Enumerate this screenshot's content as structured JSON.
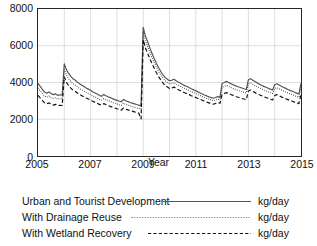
{
  "chart_data": {
    "type": "line",
    "title": "",
    "xlabel": "Year",
    "ylabel": "",
    "unit": "kg/day",
    "xlim": [
      2005,
      2015
    ],
    "ylim": [
      0,
      8000
    ],
    "yticks": [
      0,
      2000,
      4000,
      6000,
      8000
    ],
    "ytick_labels": [
      "0",
      "2000",
      "4000",
      "6000",
      "8000"
    ],
    "xticks": [
      2005,
      2007,
      2009,
      2011,
      2013,
      2015
    ],
    "xtick_labels": [
      "2005",
      "2007",
      "2009",
      "2011",
      "2013",
      "2015"
    ],
    "minor_xgrid_years": [
      2006,
      2008,
      2010,
      2012,
      2014
    ],
    "grid": true,
    "legend_position": "below-axes",
    "series": [
      {
        "name": "Urban and Tourist Development",
        "style": "solid",
        "color": "#555555",
        "unit": "kg/day",
        "x": [
          2005.0,
          2005.08,
          2005.17,
          2005.25,
          2005.33,
          2005.42,
          2005.5,
          2005.58,
          2005.67,
          2005.75,
          2005.83,
          2005.92,
          2006.0,
          2006.08,
          2006.17,
          2006.25,
          2006.33,
          2006.42,
          2006.5,
          2006.58,
          2006.67,
          2006.75,
          2006.83,
          2006.92,
          2007.0,
          2007.08,
          2007.17,
          2007.25,
          2007.33,
          2007.42,
          2007.5,
          2007.58,
          2007.67,
          2007.75,
          2007.83,
          2007.92,
          2008.0,
          2008.08,
          2008.17,
          2008.25,
          2008.33,
          2008.42,
          2008.5,
          2008.58,
          2008.67,
          2008.75,
          2008.83,
          2008.92,
          2009.0,
          2009.08,
          2009.17,
          2009.25,
          2009.33,
          2009.42,
          2009.5,
          2009.58,
          2009.67,
          2009.75,
          2009.83,
          2009.92,
          2010.0,
          2010.08,
          2010.17,
          2010.25,
          2010.33,
          2010.42,
          2010.5,
          2010.58,
          2010.67,
          2010.75,
          2010.83,
          2010.92,
          2011.0,
          2011.08,
          2011.17,
          2011.25,
          2011.33,
          2011.42,
          2011.5,
          2011.58,
          2011.67,
          2011.75,
          2011.83,
          2011.92,
          2012.0,
          2012.08,
          2012.17,
          2012.25,
          2012.33,
          2012.42,
          2012.5,
          2012.58,
          2012.67,
          2012.75,
          2012.83,
          2012.92,
          2013.0,
          2013.08,
          2013.17,
          2013.25,
          2013.33,
          2013.42,
          2013.5,
          2013.58,
          2013.67,
          2013.75,
          2013.83,
          2013.92,
          2014.0,
          2014.08,
          2014.17,
          2014.25,
          2014.33,
          2014.42,
          2014.5,
          2014.58,
          2014.67,
          2014.75,
          2014.83,
          2014.92,
          2015.0
        ],
        "y": [
          3950,
          3800,
          3620,
          3480,
          3420,
          3480,
          3400,
          3340,
          3380,
          3300,
          3330,
          3320,
          5020,
          4700,
          4480,
          4330,
          4200,
          4120,
          4020,
          3930,
          3850,
          3780,
          3700,
          3640,
          3580,
          3500,
          3430,
          3370,
          3300,
          3250,
          3350,
          3280,
          3220,
          3180,
          3120,
          3070,
          3030,
          2990,
          2950,
          3080,
          3010,
          2960,
          2910,
          2880,
          2840,
          2800,
          2770,
          2740,
          7000,
          6550,
          6200,
          5900,
          5600,
          5300,
          5050,
          4820,
          4600,
          4420,
          4280,
          4180,
          4100,
          4120,
          4180,
          4100,
          4030,
          3960,
          3890,
          3830,
          3780,
          3720,
          3660,
          3600,
          3550,
          3490,
          3430,
          3370,
          3320,
          3270,
          3220,
          3180,
          3140,
          3180,
          3230,
          3190,
          3950,
          4000,
          4060,
          4000,
          3940,
          3880,
          3830,
          3780,
          3740,
          3700,
          3660,
          3620,
          4150,
          4200,
          4120,
          4050,
          3980,
          3910,
          3850,
          3790,
          3740,
          3690,
          3640,
          3590,
          3880,
          3930,
          3860,
          3800,
          3740,
          3680,
          3620,
          3570,
          3520,
          3470,
          3420,
          3380,
          3950
        ]
      },
      {
        "name": "With Drainage Reuse",
        "style": "dotted",
        "color": "#3a3a3a",
        "unit": "kg/day",
        "x": [
          2005.0,
          2005.08,
          2005.17,
          2005.25,
          2005.33,
          2005.42,
          2005.5,
          2005.58,
          2005.67,
          2005.75,
          2005.83,
          2005.92,
          2006.0,
          2006.08,
          2006.17,
          2006.25,
          2006.33,
          2006.42,
          2006.5,
          2006.58,
          2006.67,
          2006.75,
          2006.83,
          2006.92,
          2007.0,
          2007.08,
          2007.17,
          2007.25,
          2007.33,
          2007.42,
          2007.5,
          2007.58,
          2007.67,
          2007.75,
          2007.83,
          2007.92,
          2008.0,
          2008.08,
          2008.17,
          2008.25,
          2008.33,
          2008.42,
          2008.5,
          2008.58,
          2008.67,
          2008.75,
          2008.83,
          2008.92,
          2009.0,
          2009.08,
          2009.17,
          2009.25,
          2009.33,
          2009.42,
          2009.5,
          2009.58,
          2009.67,
          2009.75,
          2009.83,
          2009.92,
          2010.0,
          2010.08,
          2010.17,
          2010.25,
          2010.33,
          2010.42,
          2010.5,
          2010.58,
          2010.67,
          2010.75,
          2010.83,
          2010.92,
          2011.0,
          2011.08,
          2011.17,
          2011.25,
          2011.33,
          2011.42,
          2011.5,
          2011.58,
          2011.67,
          2011.75,
          2011.83,
          2011.92,
          2012.0,
          2012.08,
          2012.17,
          2012.25,
          2012.33,
          2012.42,
          2012.5,
          2012.58,
          2012.67,
          2012.75,
          2012.83,
          2012.92,
          2013.0,
          2013.08,
          2013.17,
          2013.25,
          2013.33,
          2013.42,
          2013.5,
          2013.58,
          2013.67,
          2013.75,
          2013.83,
          2013.92,
          2014.0,
          2014.08,
          2014.17,
          2014.25,
          2014.33,
          2014.42,
          2014.5,
          2014.58,
          2014.67,
          2014.75,
          2014.83,
          2014.92,
          2015.0
        ],
        "y": [
          3700,
          3560,
          3390,
          3260,
          3200,
          3260,
          3180,
          3130,
          3170,
          3090,
          3120,
          3110,
          4700,
          4400,
          4190,
          4050,
          3930,
          3850,
          3760,
          3670,
          3600,
          3530,
          3460,
          3400,
          3350,
          3270,
          3200,
          3150,
          3080,
          3040,
          3130,
          3070,
          3010,
          2970,
          2920,
          2870,
          2830,
          2790,
          2760,
          2880,
          2810,
          2770,
          2720,
          2690,
          2650,
          2620,
          2590,
          2560,
          6730,
          6290,
          5950,
          5660,
          5370,
          5080,
          4840,
          4620,
          4410,
          4240,
          4100,
          4000,
          3920,
          3940,
          4000,
          3920,
          3850,
          3790,
          3720,
          3670,
          3620,
          3560,
          3500,
          3450,
          3400,
          3340,
          3290,
          3230,
          3180,
          3130,
          3090,
          3050,
          3010,
          3050,
          3090,
          3060,
          3740,
          3790,
          3840,
          3790,
          3730,
          3670,
          3620,
          3580,
          3540,
          3500,
          3460,
          3430,
          3930,
          3980,
          3900,
          3840,
          3770,
          3710,
          3650,
          3590,
          3540,
          3500,
          3450,
          3400,
          3670,
          3720,
          3660,
          3600,
          3540,
          3490,
          3430,
          3380,
          3340,
          3290,
          3240,
          3200,
          3740
        ]
      },
      {
        "name": "With Wetland Recovery",
        "style": "dashed",
        "color": "#111111",
        "unit": "kg/day",
        "x": [
          2005.0,
          2005.08,
          2005.17,
          2005.25,
          2005.33,
          2005.42,
          2005.5,
          2005.58,
          2005.67,
          2005.75,
          2005.83,
          2005.92,
          2006.0,
          2006.08,
          2006.17,
          2006.25,
          2006.33,
          2006.42,
          2006.5,
          2006.58,
          2006.67,
          2006.75,
          2006.83,
          2006.92,
          2007.0,
          2007.08,
          2007.17,
          2007.25,
          2007.33,
          2007.42,
          2007.5,
          2007.58,
          2007.67,
          2007.75,
          2007.83,
          2007.92,
          2008.0,
          2008.08,
          2008.17,
          2008.25,
          2008.33,
          2008.42,
          2008.5,
          2008.58,
          2008.67,
          2008.75,
          2008.83,
          2008.92,
          2009.0,
          2009.08,
          2009.17,
          2009.25,
          2009.33,
          2009.42,
          2009.5,
          2009.58,
          2009.67,
          2009.75,
          2009.83,
          2009.92,
          2010.0,
          2010.08,
          2010.17,
          2010.25,
          2010.33,
          2010.42,
          2010.5,
          2010.58,
          2010.67,
          2010.75,
          2010.83,
          2010.92,
          2011.0,
          2011.08,
          2011.17,
          2011.25,
          2011.33,
          2011.42,
          2011.5,
          2011.58,
          2011.67,
          2011.75,
          2011.83,
          2011.92,
          2012.0,
          2012.08,
          2012.17,
          2012.25,
          2012.33,
          2012.42,
          2012.5,
          2012.58,
          2012.67,
          2012.75,
          2012.83,
          2012.92,
          2013.0,
          2013.08,
          2013.17,
          2013.25,
          2013.33,
          2013.42,
          2013.5,
          2013.58,
          2013.67,
          2013.75,
          2013.83,
          2013.92,
          2014.0,
          2014.08,
          2014.17,
          2014.25,
          2014.33,
          2014.42,
          2014.5,
          2014.58,
          2014.67,
          2014.75,
          2014.83,
          2014.92,
          2015.0
        ],
        "y": [
          3300,
          3160,
          3010,
          2890,
          2840,
          2890,
          2820,
          2770,
          2810,
          2740,
          2760,
          2750,
          4300,
          4010,
          3820,
          3690,
          3580,
          3510,
          3430,
          3350,
          3280,
          3220,
          3160,
          3100,
          3050,
          2980,
          2920,
          2870,
          2810,
          2770,
          2850,
          2800,
          2740,
          2700,
          2650,
          2610,
          2570,
          2540,
          2500,
          2610,
          2550,
          2510,
          2470,
          2440,
          2400,
          2370,
          2340,
          2020,
          6330,
          5900,
          5580,
          5310,
          5040,
          4770,
          4540,
          4330,
          4140,
          3980,
          3840,
          3750,
          3670,
          3690,
          3750,
          3670,
          3610,
          3550,
          3490,
          3440,
          3390,
          3340,
          3280,
          3230,
          3180,
          3130,
          3080,
          3030,
          2980,
          2930,
          2890,
          2850,
          2820,
          2860,
          2900,
          2870,
          3350,
          3400,
          3450,
          3400,
          3350,
          3300,
          3250,
          3210,
          3170,
          3130,
          3100,
          3060,
          3540,
          3590,
          3510,
          3450,
          3390,
          3330,
          3280,
          3230,
          3180,
          3140,
          3090,
          3050,
          3290,
          3340,
          3280,
          3220,
          3170,
          3120,
          3070,
          3020,
          2980,
          2930,
          2890,
          2850,
          3350
        ]
      }
    ]
  }
}
